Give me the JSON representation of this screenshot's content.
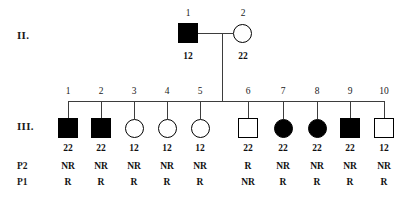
{
  "figure": {
    "type": "pedigree-chart",
    "line_color": "#3d3d3d",
    "symbol_color": "#000000"
  },
  "generations": [
    {
      "label": "II.",
      "individuals": [
        {
          "id": "1",
          "sex": "male",
          "shape": "square",
          "affected": true,
          "fill": "filled",
          "genotype": "12"
        },
        {
          "id": "2",
          "sex": "female",
          "shape": "circle",
          "affected": false,
          "fill": "open",
          "genotype": "22"
        }
      ]
    },
    {
      "label": "III.",
      "row_labels": {
        "p2": "P2",
        "p1": "P1"
      },
      "individuals": [
        {
          "id": "1",
          "sex": "male",
          "shape": "square",
          "affected": true,
          "fill": "filled",
          "genotype": "22",
          "p2": "NR",
          "p1": "R"
        },
        {
          "id": "2",
          "sex": "male",
          "shape": "square",
          "affected": true,
          "fill": "filled",
          "genotype": "22",
          "p2": "NR",
          "p1": "R"
        },
        {
          "id": "3",
          "sex": "female",
          "shape": "circle",
          "affected": false,
          "fill": "open",
          "genotype": "12",
          "p2": "NR",
          "p1": "R"
        },
        {
          "id": "4",
          "sex": "female",
          "shape": "circle",
          "affected": false,
          "fill": "open",
          "genotype": "12",
          "p2": "NR",
          "p1": "R"
        },
        {
          "id": "5",
          "sex": "female",
          "shape": "circle",
          "affected": false,
          "fill": "open",
          "genotype": "12",
          "p2": "NR",
          "p1": "R"
        },
        {
          "id": "6",
          "sex": "male",
          "shape": "square",
          "affected": false,
          "fill": "open",
          "genotype": "22",
          "p2": "R",
          "p1": "NR"
        },
        {
          "id": "7",
          "sex": "female",
          "shape": "circle",
          "affected": true,
          "fill": "filled",
          "genotype": "22",
          "p2": "NR",
          "p1": "R"
        },
        {
          "id": "8",
          "sex": "female",
          "shape": "circle",
          "affected": true,
          "fill": "filled",
          "genotype": "22",
          "p2": "NR",
          "p1": "R"
        },
        {
          "id": "9",
          "sex": "male",
          "shape": "square",
          "affected": true,
          "fill": "filled",
          "genotype": "22",
          "p2": "NR",
          "p1": "R"
        },
        {
          "id": "10",
          "sex": "male",
          "shape": "square",
          "affected": false,
          "fill": "open",
          "genotype": "12",
          "p2": "NR",
          "p1": "R"
        }
      ]
    }
  ]
}
